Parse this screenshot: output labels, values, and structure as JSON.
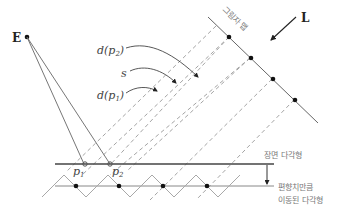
{
  "diagram": {
    "labels": {
      "eye": "E",
      "light": "L",
      "shadow_map": "그림자 맵",
      "d_p2": "d(p",
      "d_p2_sub": "2",
      "d_p1": "d(p",
      "d_p1_sub": "1",
      "close_paren": ")",
      "s": "s",
      "p1": "p",
      "p1_sub": "1",
      "p2": "p",
      "p2_sub": "2",
      "scene_polygon": "장면 다각형",
      "offset_polygon_line1": "편향치만큼",
      "offset_polygon_line2": "이동된 다각형"
    },
    "colors": {
      "line": "#555555",
      "dashed": "#9a9a9a",
      "zigzag": "#a8a8a8",
      "dot": "#111111",
      "text": "#333333",
      "label_gray": "#777777"
    }
  }
}
